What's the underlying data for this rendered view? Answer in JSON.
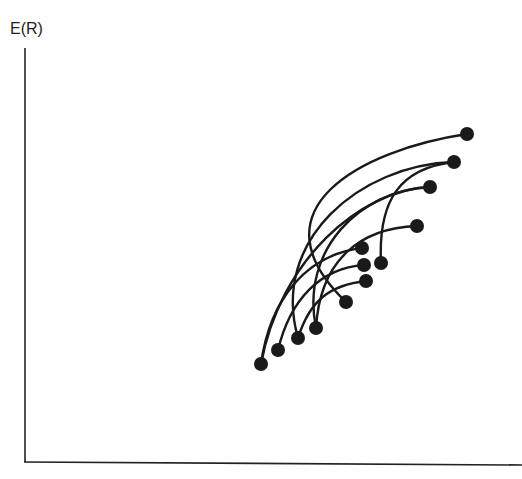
{
  "chart_data": {
    "type": "diagram",
    "title": "",
    "ylabel": "E(R)",
    "xlabel": "",
    "points": [
      {
        "x": 261,
        "y": 364
      },
      {
        "x": 278,
        "y": 350
      },
      {
        "x": 298,
        "y": 338
      },
      {
        "x": 316,
        "y": 328
      },
      {
        "x": 346,
        "y": 302
      },
      {
        "x": 366,
        "y": 281
      },
      {
        "x": 364,
        "y": 265
      },
      {
        "x": 362,
        "y": 248
      },
      {
        "x": 381,
        "y": 263
      },
      {
        "x": 467,
        "y": 134
      },
      {
        "x": 454,
        "y": 162
      },
      {
        "x": 430,
        "y": 187
      },
      {
        "x": 417,
        "y": 226
      }
    ],
    "curves": [
      "M261,364 C270,300 305,255 362,248",
      "M278,350 C290,300 320,268 364,265",
      "M298,338 C270,240 360,165 454,162",
      "M316,328 C300,250 360,190 430,187",
      "M346,302 C250,210 360,150 467,134",
      "M298,338 C310,300 330,285 366,281",
      "M381,263 C378,200 400,168 454,162",
      "M316,328 C320,260 360,228 417,226",
      "M261,364 C280,260 360,190 430,187"
    ]
  },
  "axes": {
    "y_label": "E(R)"
  }
}
